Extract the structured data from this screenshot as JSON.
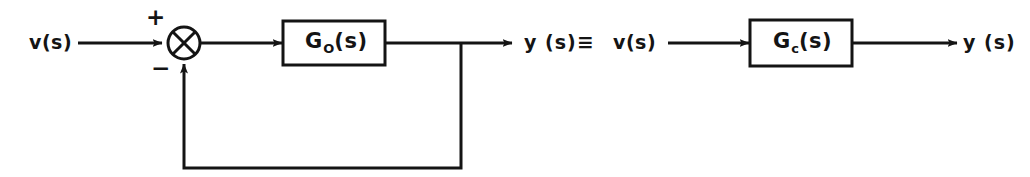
{
  "diagram": {
    "stroke_color": "#141414",
    "background_color": "#ffffff",
    "line_width": 3
  },
  "left_system": {
    "input_label": "v(s)",
    "summing_junction": {
      "name": "summing-junction",
      "symbol": "cross-circle",
      "plus_sign": "+",
      "minus_sign": "−"
    },
    "forward_block": {
      "label_main": "G",
      "label_subscript": "O",
      "label_arg": "(s)",
      "full_label": "G_O(s)"
    },
    "output_label": "y (s)"
  },
  "equivalence": {
    "symbol": "≡"
  },
  "right_system": {
    "input_label": "v(s)",
    "block": {
      "label_main": "G",
      "label_subscript": "c",
      "label_arg": "(s)",
      "full_label": "G_c(s)"
    },
    "output_label": "y (s)"
  }
}
